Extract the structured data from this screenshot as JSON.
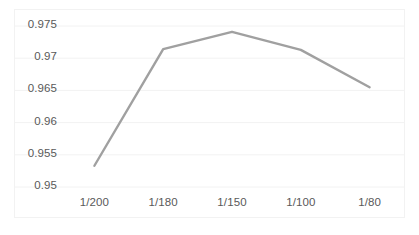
{
  "chart_data": {
    "type": "line",
    "title": "",
    "subtitle": "",
    "xlabel": "",
    "ylabel": "",
    "categories": [
      "1/200",
      "1/180",
      "1/150",
      "1/100",
      "1/80"
    ],
    "values": [
      0.9533,
      0.9714,
      0.9741,
      0.9713,
      0.9655
    ],
    "series": [
      {
        "name": "",
        "values": [
          0.9533,
          0.9714,
          0.9741,
          0.9713,
          0.9655
        ]
      }
    ],
    "ylim": [
      0.95,
      0.975
    ],
    "yticks": [
      0.975,
      0.97,
      0.965,
      0.96,
      0.955,
      0.95
    ],
    "ytick_labels": [
      "0.975",
      "0.97",
      "0.965",
      "0.96",
      "0.955",
      "0.95"
    ],
    "xtick_labels": [
      "1/200",
      "1/180",
      "1/150",
      "1/100",
      "1/80"
    ],
    "grid": true,
    "grid_axis": "y",
    "legend": false,
    "legend_position": "none",
    "line_color": "#a0a0a0",
    "grid_color": "#f2f2f2",
    "border_color": "#f2f2f2",
    "tick_label_color": "#595959",
    "background_color": "#ffffff",
    "markers": false,
    "annotations": []
  },
  "axes": {
    "y": {
      "ticks": [
        {
          "label": "0.975",
          "value": 0.975
        },
        {
          "label": "0.97",
          "value": 0.97
        },
        {
          "label": "0.965",
          "value": 0.965
        },
        {
          "label": "0.96",
          "value": 0.96
        },
        {
          "label": "0.955",
          "value": 0.955
        },
        {
          "label": "0.95",
          "value": 0.95
        }
      ]
    },
    "x": {
      "ticks": [
        {
          "label": "1/200"
        },
        {
          "label": "1/180"
        },
        {
          "label": "1/150"
        },
        {
          "label": "1/100"
        },
        {
          "label": "1/80"
        }
      ]
    }
  }
}
